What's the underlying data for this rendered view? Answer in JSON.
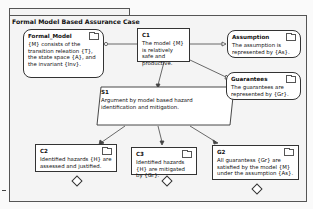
{
  "package": {
    "title": "Formal Model Based Assurance Case"
  },
  "nodes": {
    "formal_model": {
      "id": "Formal_Model",
      "text": "{M} consists of the transition releation {T}, the state space {A}, and the invariant {Inv}."
    },
    "c1": {
      "id": "C1",
      "text": "The model {M} is relatively safe and productive."
    },
    "assumption": {
      "id": "Assumption",
      "text": "The assumption is represented by {As}."
    },
    "guarantees": {
      "id": "Guarantees",
      "text": "The guarantees are represented by {Gr}."
    },
    "s1": {
      "id": "S1",
      "text": "Argument by model based hazard identification and mitigation."
    },
    "c2": {
      "id": "C2",
      "text": "Identified hazards {H} are assessed and justified."
    },
    "c3": {
      "id": "C3",
      "text": "Identified hazards {H} are mitigated by {Gr}."
    },
    "g2": {
      "id": "G2",
      "text": "All guarantess {Gr} are satisfied by the model {M} under the assumption {As}."
    }
  },
  "colors": {
    "line": "#333333",
    "background": "#f4f4f4",
    "node_fill": "#ffffff"
  }
}
